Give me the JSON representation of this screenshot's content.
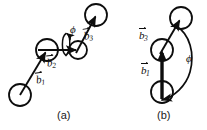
{
  "figure": {
    "type": "scientific-diagram",
    "background_color": "#ffffff",
    "stroke_color": "#0d0d0d",
    "panels": [
      {
        "id": "a",
        "caption": "(a)",
        "labels": {
          "b1": "b",
          "b1_sub": "1",
          "b2": "b",
          "b2_sub": "2",
          "b3": "b",
          "b3_sub": "3",
          "phi": "ϕ"
        },
        "atoms": [
          {
            "name": "atom-1",
            "cx": 20,
            "cy": 95,
            "r": 11
          },
          {
            "name": "atom-2",
            "cx": 47,
            "cy": 50,
            "r": 11
          },
          {
            "name": "atom-3",
            "cx": 78,
            "cy": 50,
            "r": 9
          },
          {
            "name": "atom-4",
            "cx": 96,
            "cy": 15,
            "r": 11
          }
        ],
        "vectors": [
          {
            "name": "b1",
            "x1": 20,
            "y1": 95,
            "x2": 47,
            "y2": 50
          },
          {
            "name": "b2",
            "x1": 47,
            "y1": 50,
            "x2": 78,
            "y2": 50
          },
          {
            "name": "b3",
            "x1": 78,
            "y1": 50,
            "x2": 97,
            "y2": 14
          }
        ],
        "rotation_ellipse": {
          "cx": 66,
          "cy": 45,
          "rx": 5,
          "ry": 12
        }
      },
      {
        "id": "b",
        "caption": "(b)",
        "labels": {
          "b1": "b",
          "b1_sub": "1",
          "b3": "b",
          "b3_sub": "3",
          "phi": "ϕ"
        },
        "atoms": [
          {
            "name": "atom-1",
            "cx": 162,
            "cy": 92,
            "r": 11
          },
          {
            "name": "atom-2",
            "cx": 162,
            "cy": 50,
            "r": 11
          },
          {
            "name": "atom-3",
            "cx": 181,
            "cy": 18,
            "r": 11
          }
        ],
        "vectors": [
          {
            "name": "b1",
            "x1": 162,
            "y1": 92,
            "x2": 162,
            "y2": 50
          },
          {
            "name": "b3",
            "x1": 162,
            "y1": 50,
            "x2": 182,
            "y2": 19
          }
        ],
        "phi_arc": {
          "name": "phi-arc",
          "from_x": 178,
          "from_y": 30,
          "to_x": 162,
          "to_y": 101,
          "label_x": 190,
          "label_y": 58
        }
      }
    ]
  }
}
